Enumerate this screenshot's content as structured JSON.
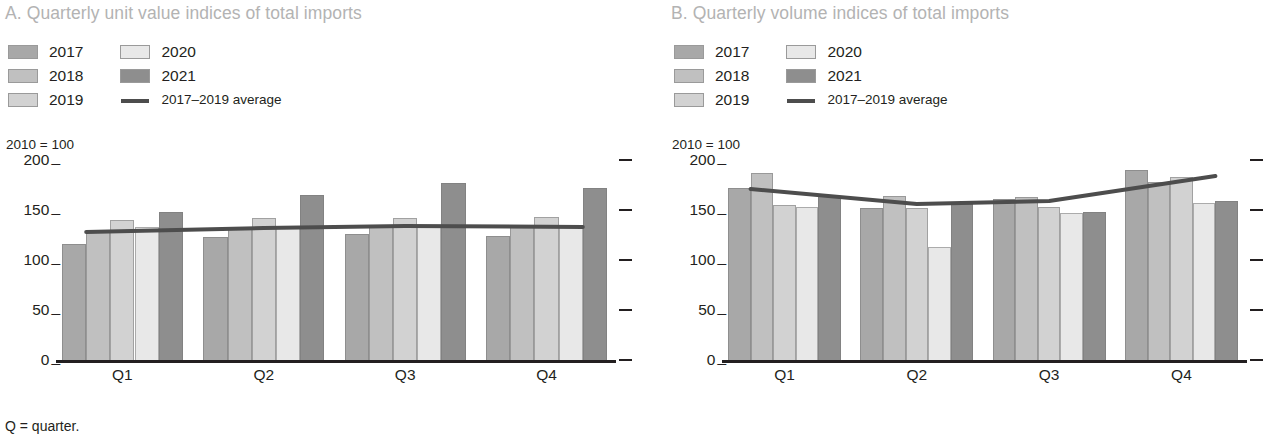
{
  "footnote": "Q = quarter.",
  "panels": [
    {
      "title": "A. Quarterly unit value indices of total imports",
      "axis_note": "2010 = 100"
    },
    {
      "title": "B. Quarterly volume indices of total imports",
      "axis_note": "2010 = 100"
    }
  ],
  "legend": {
    "col1": [
      {
        "label": "2017",
        "color": "#a8a8a8"
      },
      {
        "label": "2018",
        "color": "#c0c0c0"
      },
      {
        "label": "2019",
        "color": "#d2d2d2"
      }
    ],
    "col2": [
      {
        "label": "2020",
        "color": "#e8e8e8"
      },
      {
        "label": "2021",
        "color": "#8e8e8e"
      },
      {
        "label": "2017–2019 average",
        "color": "#4d4d4d",
        "type": "line"
      }
    ]
  },
  "chart_data": [
    {
      "type": "bar",
      "title": "A. Quarterly unit value indices of total imports",
      "subtitle": "2010 = 100",
      "xlabel": "",
      "ylabel": "",
      "ylim": [
        0,
        200
      ],
      "yticks": [
        0,
        50,
        100,
        150,
        200
      ],
      "grid": false,
      "legend_position": "top-left",
      "categories": [
        "Q1",
        "Q2",
        "Q3",
        "Q4"
      ],
      "series": [
        {
          "name": "2017",
          "values": [
            116,
            123,
            126,
            124
          ]
        },
        {
          "name": "2018",
          "values": [
            128,
            131,
            133,
            133
          ]
        },
        {
          "name": "2019",
          "values": [
            140,
            142,
            142,
            143
          ]
        },
        {
          "name": "2020",
          "values": [
            133,
            134,
            135,
            135
          ]
        },
        {
          "name": "2021",
          "values": [
            148,
            165,
            177,
            172
          ]
        }
      ],
      "average_line": {
        "name": "2017–2019 average",
        "values": [
          128,
          132,
          134,
          133
        ]
      }
    },
    {
      "type": "bar",
      "title": "B. Quarterly volume indices of total imports",
      "subtitle": "2010 = 100",
      "xlabel": "",
      "ylabel": "",
      "ylim": [
        0,
        200
      ],
      "yticks": [
        0,
        50,
        100,
        150,
        200
      ],
      "grid": false,
      "legend_position": "top-left",
      "categories": [
        "Q1",
        "Q2",
        "Q3",
        "Q4"
      ],
      "series": [
        {
          "name": "2017",
          "values": [
            172,
            152,
            161,
            190
          ]
        },
        {
          "name": "2018",
          "values": [
            187,
            164,
            163,
            178
          ]
        },
        {
          "name": "2019",
          "values": [
            155,
            152,
            153,
            183
          ]
        },
        {
          "name": "2020",
          "values": [
            153,
            113,
            147,
            157
          ]
        },
        {
          "name": "2021",
          "values": [
            164,
            156,
            148,
            159
          ]
        }
      ],
      "average_line": {
        "name": "2017–2019 average",
        "values": [
          171,
          156,
          159,
          184
        ]
      }
    }
  ]
}
